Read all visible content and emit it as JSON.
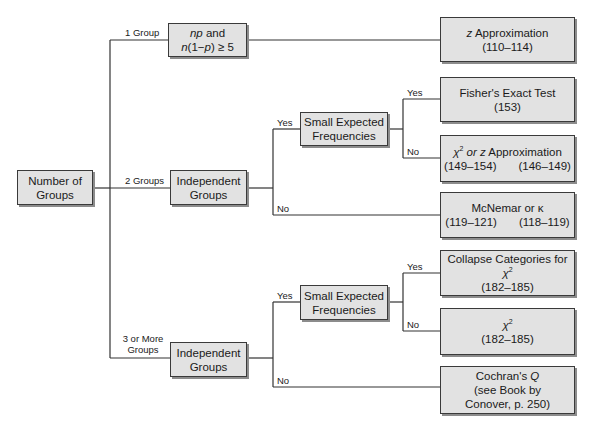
{
  "diagram": {
    "type": "decision-tree",
    "root": {
      "label_line1": "Number of",
      "label_line2": "Groups"
    },
    "edges": {
      "one_group": "1 Group",
      "two_groups": "2 Groups",
      "three_more_line1": "3 or More",
      "three_more_line2": "Groups",
      "yes": "Yes",
      "no": "No"
    },
    "nodes": {
      "np_condition": {
        "line1_italic": "np",
        "line1_rest": " and",
        "line2_a": "n",
        "line2_b": "(1−",
        "line2_c": "p",
        "line2_d": ") ≥ 5"
      },
      "z_approx": {
        "italic": "z",
        "rest": " Approximation",
        "pages": "(110–114)"
      },
      "indep_two": {
        "line1": "Independent",
        "line2": "Groups"
      },
      "small_freq_two": {
        "line1": "Small Expected",
        "line2": "Frequencies"
      },
      "fisher": {
        "line1": "Fisher's Exact Test",
        "pages": "(153)"
      },
      "chi_or_z": {
        "chi": "χ",
        "sup": "2",
        "italic_mid": " or z",
        "rest": " Approximation",
        "pages_a": "(149–154)",
        "pages_b": "(146–149)"
      },
      "mcnemar": {
        "line1": "McNemar or κ",
        "pages_a": "(119–121)",
        "pages_b": "(118–119)"
      },
      "indep_three": {
        "line1": "Independent",
        "line2": "Groups"
      },
      "small_freq_three": {
        "line1": "Small Expected",
        "line2": "Frequencies"
      },
      "collapse": {
        "line1": "Collapse Categories for ",
        "chi": "χ",
        "sup": "2",
        "pages": "(182–185)"
      },
      "chi_sq": {
        "chi": "χ",
        "sup": "2",
        "pages": "(182–185)"
      },
      "cochran": {
        "line1": "Cochran's ",
        "italic": "Q",
        "line2": "(see Book by",
        "line3": "Conover, p. 250)"
      }
    },
    "colors": {
      "box_fill": "#e2e2e2",
      "box_border": "#3a3a3a",
      "shadow": "#8c8c8c",
      "line": "#333333"
    }
  }
}
